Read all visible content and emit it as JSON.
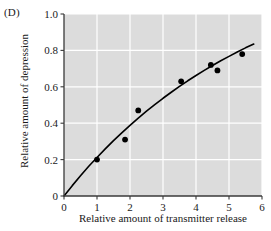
{
  "panel": {
    "label": "(D)"
  },
  "chart_data": {
    "type": "scatter",
    "title": "",
    "subtitle": "",
    "xlabel": "Relative amount of transmitter release",
    "ylabel": "Relative amount of depression",
    "xlim": [
      0,
      6
    ],
    "ylim": [
      0,
      1.0
    ],
    "xticks": [
      0,
      1,
      2,
      3,
      4,
      5,
      6
    ],
    "xticklabels": [
      "0",
      "1",
      "2",
      "3",
      "4",
      "5",
      "6"
    ],
    "yticks": [
      0,
      0.2,
      0.4,
      0.6,
      0.8,
      1.0
    ],
    "yticklabels": [
      "0",
      "0.2",
      "0.4",
      "0.6",
      "0.8",
      "1.0"
    ],
    "grid": true,
    "grid_color": "#ffffff",
    "plot_background": "#dcdcdc",
    "legend": null,
    "marker_color": "#000000",
    "line_color": "#000000",
    "series": [
      {
        "name": "data",
        "type": "scatter",
        "x": [
          1.0,
          1.85,
          2.25,
          3.55,
          4.45,
          4.65,
          5.4
        ],
        "y": [
          0.2,
          0.31,
          0.47,
          0.63,
          0.72,
          0.69,
          0.78
        ]
      },
      {
        "name": "fit",
        "type": "line",
        "x": [
          0,
          0.25,
          0.5,
          0.75,
          1.0,
          1.25,
          1.5,
          1.75,
          2.0,
          2.25,
          2.5,
          2.75,
          3.0,
          3.25,
          3.5,
          3.75,
          4.0,
          4.25,
          4.5,
          4.75,
          5.0,
          5.25,
          5.5,
          5.75
        ],
        "y": [
          0,
          0.057,
          0.111,
          0.163,
          0.212,
          0.259,
          0.304,
          0.347,
          0.388,
          0.428,
          0.466,
          0.502,
          0.537,
          0.57,
          0.602,
          0.633,
          0.662,
          0.69,
          0.717,
          0.743,
          0.767,
          0.791,
          0.814,
          0.835
        ]
      }
    ]
  }
}
